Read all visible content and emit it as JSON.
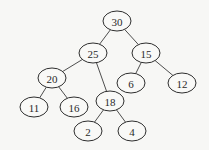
{
  "diagram": {
    "type": "binary-tree",
    "nodes": [
      {
        "id": "n30",
        "label": "30",
        "x": 117,
        "y": 21
      },
      {
        "id": "n25",
        "label": "25",
        "x": 93,
        "y": 53
      },
      {
        "id": "n15",
        "label": "15",
        "x": 146,
        "y": 53
      },
      {
        "id": "n20",
        "label": "20",
        "x": 52,
        "y": 78
      },
      {
        "id": "n6",
        "label": "6",
        "x": 131,
        "y": 83
      },
      {
        "id": "n12",
        "label": "12",
        "x": 182,
        "y": 83
      },
      {
        "id": "n11",
        "label": "11",
        "x": 34,
        "y": 107
      },
      {
        "id": "n16",
        "label": "16",
        "x": 74,
        "y": 107
      },
      {
        "id": "n18",
        "label": "18",
        "x": 110,
        "y": 101
      },
      {
        "id": "n2",
        "label": "2",
        "x": 88,
        "y": 131
      },
      {
        "id": "n4",
        "label": "4",
        "x": 132,
        "y": 131
      }
    ],
    "edges": [
      [
        "n30",
        "n25"
      ],
      [
        "n30",
        "n15"
      ],
      [
        "n25",
        "n20"
      ],
      [
        "n25",
        "n18"
      ],
      [
        "n15",
        "n6"
      ],
      [
        "n15",
        "n12"
      ],
      [
        "n20",
        "n11"
      ],
      [
        "n20",
        "n16"
      ],
      [
        "n18",
        "n2"
      ],
      [
        "n18",
        "n4"
      ]
    ]
  }
}
